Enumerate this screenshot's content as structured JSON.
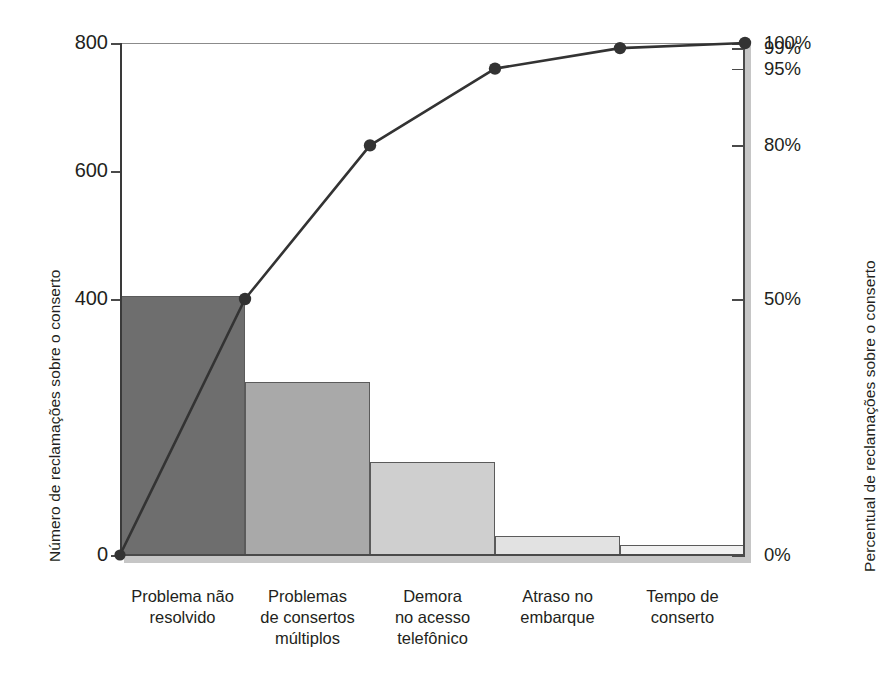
{
  "chart_data": {
    "type": "bar",
    "title": "",
    "subtitle": "",
    "xlabel": "",
    "ylabel": "Número de reclamações sobre o conserto",
    "y2label": "Percentual de reclamações sobre o conserto",
    "grid": false,
    "legend": "none",
    "categories": [
      "Problema não resolvido",
      "Problemas de consertos múltiplos",
      "Demora no acesso telefônico",
      "Atraso no embarque",
      "Tempo de conserto"
    ],
    "category_lines": [
      [
        "Problema não",
        "resolvido"
      ],
      [
        "Problemas",
        "de consertos",
        "múltiplos"
      ],
      [
        "Demora",
        "no acesso",
        "telefônico"
      ],
      [
        "Atraso no",
        "embarque"
      ],
      [
        "Tempo de",
        "conserto"
      ]
    ],
    "series": [
      {
        "name": "Número de reclamações sobre o conserto",
        "type": "bar",
        "axis": "left",
        "values": [
          405,
          270,
          145,
          30,
          15
        ],
        "colors": [
          "#6e6e6e",
          "#a9a9a9",
          "#cfcfcf",
          "#e2e2e2",
          "#f0f0f0"
        ]
      },
      {
        "name": "Percentual de reclamações sobre o conserto",
        "type": "line",
        "axis": "right",
        "values": [
          50,
          80,
          95,
          99,
          100
        ],
        "value_labels": [
          "50%",
          "80%",
          "95%",
          "99%",
          "100%"
        ],
        "color": "#333333",
        "marker": "circle",
        "origin_value": 0
      }
    ],
    "ylim": [
      0,
      800
    ],
    "y2lim": [
      0,
      100
    ],
    "yticks": [
      0,
      400,
      600,
      800
    ],
    "ytick_labels": [
      "0",
      "400",
      "600",
      "800"
    ],
    "y2ticks": [
      0,
      50,
      80,
      95,
      99,
      100
    ],
    "y2tick_labels": [
      "0%",
      "50%",
      "80%",
      "95%",
      "99%",
      "100%"
    ]
  },
  "axes": {
    "left_title": "Número de reclamações sobre o conserto",
    "right_title": "Percentual de reclamações sobre o conserto"
  },
  "caption": {
    "text": ""
  },
  "colors": {
    "axis": "#4a4a4a",
    "line": "#333333",
    "text": "#231f20"
  }
}
